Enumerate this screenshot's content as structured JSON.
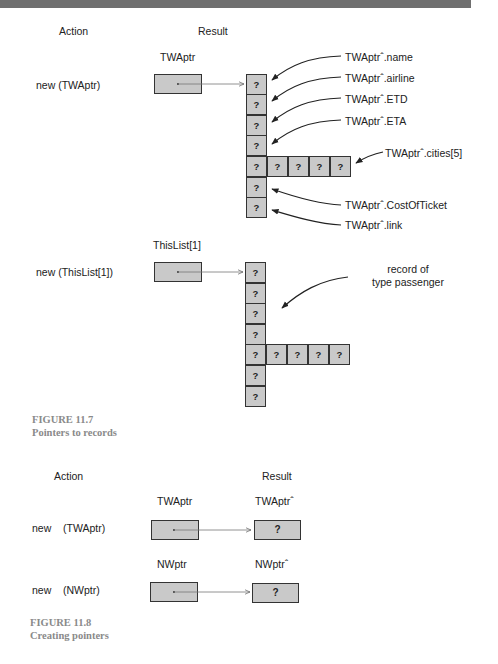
{
  "figure_11_7": {
    "headers": {
      "action": "Action",
      "result": "Result"
    },
    "example1": {
      "pointer_label": "TWAptr",
      "action": "new (TWAptr)",
      "cells": [
        "?",
        "?",
        "?",
        "?",
        "?",
        "?",
        "?"
      ],
      "array_cells": [
        "?",
        "?",
        "?",
        "?"
      ],
      "field_labels": {
        "name": "TWAptrˆ.name",
        "airline": "TWAptrˆ.airline",
        "etd": "TWAptrˆ.ETD",
        "eta": "TWAptrˆ.ETA",
        "cities": "TWAptrˆ.cities[5]",
        "cost": "TWAptrˆ.CostOfTicket",
        "link": "TWAptrˆ.link"
      }
    },
    "example2": {
      "pointer_label": "ThisList[1]",
      "action": "new (ThisList[1])",
      "cells": [
        "?",
        "?",
        "?",
        "?",
        "?",
        "?",
        "?"
      ],
      "array_cells": [
        "?",
        "?",
        "?",
        "?"
      ],
      "annotation_line1": "record of",
      "annotation_line2": "type passenger"
    },
    "caption": {
      "number": "FIGURE 11.7",
      "title": "Pointers to records"
    }
  },
  "figure_11_8": {
    "headers": {
      "action": "Action",
      "result": "Result"
    },
    "rows": [
      {
        "action_new": "new",
        "action_arg": "(TWAptr)",
        "pointer_label": "TWAptr",
        "target_label": "TWAptrˆ",
        "value": "?"
      },
      {
        "action_new": "new",
        "action_arg": "(NWptr)",
        "pointer_label": "NWptr",
        "target_label": "NWptrˆ",
        "value": "?"
      }
    ],
    "caption": {
      "number": "FIGURE 11.8",
      "title": "Creating pointers"
    }
  }
}
